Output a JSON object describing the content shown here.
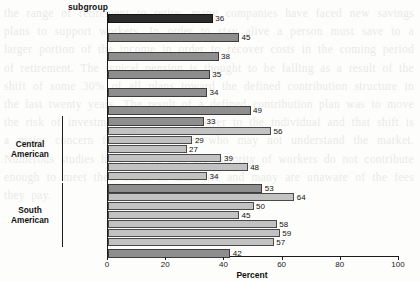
{
  "chart_data": {
    "type": "bar",
    "orientation": "horizontal",
    "title": "",
    "header_label": "subgroup",
    "xlabel": "Percent",
    "ylabel": "",
    "xlim": [
      0,
      100
    ],
    "xticks": [
      0,
      20,
      40,
      60,
      80,
      100
    ],
    "xticklabels": [
      "0",
      "20",
      "40",
      "60",
      "80",
      "100"
    ],
    "grid": false,
    "legend": "none",
    "footnote_marker": "1",
    "categories": [
      "Hispanic",
      "Cuban",
      "Dominican",
      "Mexican",
      "Puerto Rican",
      "Spaniard",
      "Total¹",
      "Costa Rican",
      "Guatemalan",
      "Honduran",
      "Nicaraguan",
      "Panamanian",
      "Salvadoran",
      "Total",
      "Chilean",
      "Colombian",
      "Ecuadorian",
      "Peruvian",
      "Venezuelan",
      "Other",
      "Other Hispanic"
    ],
    "values": [
      36,
      45,
      38,
      35,
      34,
      49,
      33,
      56,
      29,
      27,
      39,
      48,
      34,
      53,
      64,
      50,
      45,
      58,
      59,
      57,
      42
    ],
    "bars": [
      {
        "label": "Hispanic",
        "value": 36,
        "style": "dark",
        "tier": "major",
        "group": ""
      },
      {
        "label": "Cuban",
        "value": 45,
        "style": "mid",
        "tier": "major",
        "group": ""
      },
      {
        "label": "Dominican",
        "value": 38,
        "style": "mid",
        "tier": "major",
        "group": ""
      },
      {
        "label": "Mexican",
        "value": 35,
        "style": "mid",
        "tier": "major",
        "group": ""
      },
      {
        "label": "Puerto Rican",
        "value": 34,
        "style": "mid",
        "tier": "major",
        "group": ""
      },
      {
        "label": "Spaniard",
        "value": 49,
        "style": "mid",
        "tier": "major",
        "group": ""
      },
      {
        "label": "Total",
        "value": 33,
        "style": "mid",
        "tier": "subtotal",
        "group": "Central American",
        "footnote": "1"
      },
      {
        "label": "Costa Rican",
        "value": 56,
        "style": "light",
        "tier": "sub",
        "group": "Central American"
      },
      {
        "label": "Guatemalan",
        "value": 29,
        "style": "light",
        "tier": "sub",
        "group": "Central American"
      },
      {
        "label": "Honduran",
        "value": 27,
        "style": "light",
        "tier": "sub",
        "group": "Central American"
      },
      {
        "label": "Nicaraguan",
        "value": 39,
        "style": "light",
        "tier": "sub",
        "group": "Central American"
      },
      {
        "label": "Panamanian",
        "value": 48,
        "style": "light",
        "tier": "sub",
        "group": "Central American"
      },
      {
        "label": "Salvadoran",
        "value": 34,
        "style": "light",
        "tier": "sub",
        "group": "Central American"
      },
      {
        "label": "Total",
        "value": 53,
        "style": "mid",
        "tier": "subtotal",
        "group": "South American"
      },
      {
        "label": "Chilean",
        "value": 64,
        "style": "light",
        "tier": "sub",
        "group": "South American"
      },
      {
        "label": "Colombian",
        "value": 50,
        "style": "light",
        "tier": "sub",
        "group": "South American"
      },
      {
        "label": "Ecuadorian",
        "value": 45,
        "style": "light",
        "tier": "sub",
        "group": "South American"
      },
      {
        "label": "Peruvian",
        "value": 58,
        "style": "light",
        "tier": "sub",
        "group": "South American"
      },
      {
        "label": "Venezuelan",
        "value": 59,
        "style": "light",
        "tier": "sub",
        "group": "South American"
      },
      {
        "label": "Other",
        "value": 57,
        "style": "light",
        "tier": "sub",
        "group": "South American"
      },
      {
        "label": "Other Hispanic",
        "value": 42,
        "style": "mid",
        "tier": "major",
        "group": ""
      }
    ],
    "groups": [
      {
        "name": "Central American",
        "line1": "Central",
        "line2": "American",
        "first": 6,
        "last": 12
      },
      {
        "name": "South American",
        "line1": "South",
        "line2": "American",
        "first": 13,
        "last": 19
      }
    ],
    "colors": {
      "dark": "#2b2b2b",
      "mid": "#8e8e8e",
      "light": "#c2c2c2",
      "axis": "#1c1c1c",
      "text": "#111111",
      "background": "#fdfdfb"
    }
  },
  "ghost_text": "the range of retirement to retire; many companies have faced new savings plans to support workers. In order to stay alive a person must save to a larger portion of the income in order to recover costs in the coming period of retirement. The typical pension is thought to be falling as a result of the shift of some 30% of all plans toward the defined contribution structure in the last twenty years. The result of a defined contribution plan was to move the risk of investment from the employer to the individual and that shift is a major concern for future retirees who may not understand the market. Numerous studies have shown that the majority of workers do not contribute enough to meet their needs in later life and many are unaware of the fees they pay."
}
